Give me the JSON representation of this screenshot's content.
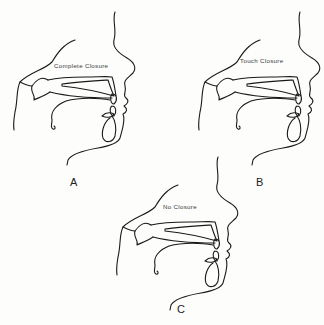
{
  "figure": {
    "panels": [
      {
        "id": "A",
        "letter": "A",
        "caption": "Complete Closure"
      },
      {
        "id": "B",
        "letter": "B",
        "caption": "Touch Closure"
      },
      {
        "id": "C",
        "letter": "C",
        "caption": "No Closure"
      }
    ],
    "colors": {
      "line": "#1a1a1a",
      "text": "#3a3a3a",
      "background": "#fdfdfc"
    }
  }
}
